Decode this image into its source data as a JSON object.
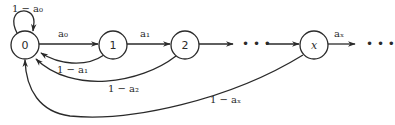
{
  "diagram": {
    "type": "state-transition-chain",
    "nodes": [
      {
        "id": "n0",
        "label": "0"
      },
      {
        "id": "n1",
        "label": "1"
      },
      {
        "id": "n2",
        "label": "2"
      },
      {
        "id": "nx",
        "label": "x"
      }
    ],
    "forward_edges": [
      {
        "from": "n0",
        "to": "n1",
        "label": "a₀"
      },
      {
        "from": "n1",
        "to": "n2",
        "label": "a₁"
      },
      {
        "from": "n2",
        "to": "ellipsis1",
        "label": ""
      },
      {
        "from": "ellipsis1",
        "to": "nx",
        "label": ""
      },
      {
        "from": "nx",
        "to": "ellipsis2",
        "label": "aₓ"
      }
    ],
    "back_edges": [
      {
        "from": "n0",
        "to": "n0",
        "label": "1 − a₀"
      },
      {
        "from": "n1",
        "to": "n0",
        "label": "1 − a₁"
      },
      {
        "from": "n2",
        "to": "n0",
        "label": "1 − a₂"
      },
      {
        "from": "nx",
        "to": "n0",
        "label": "1 − aₓ"
      }
    ],
    "ellipsis": "• • •"
  }
}
